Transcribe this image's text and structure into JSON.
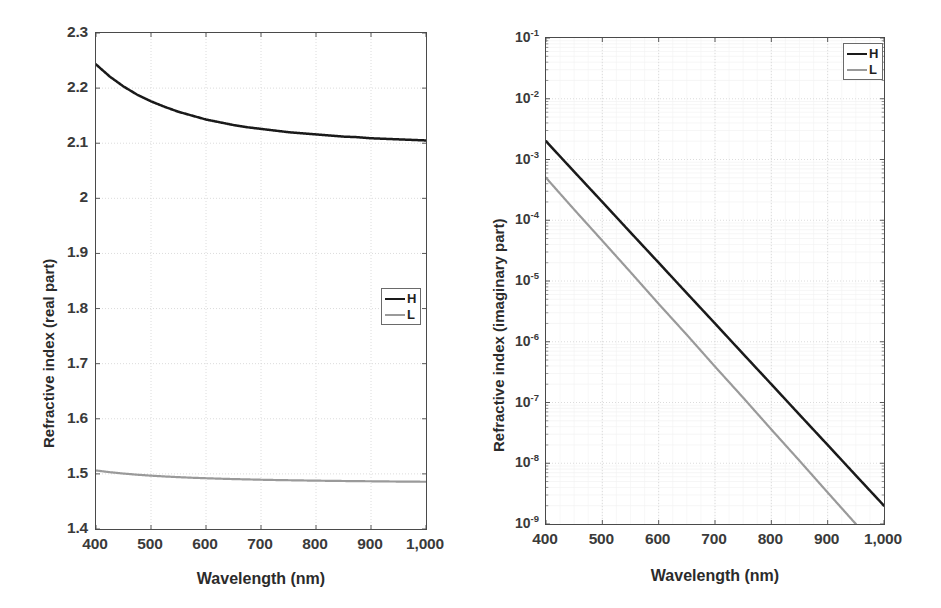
{
  "figure": {
    "panels": [
      {
        "id": "real-part",
        "legend": [
          {
            "key": "H",
            "label": "H",
            "color": "#1a1a1a"
          },
          {
            "key": "L",
            "label": "L",
            "color": "#9a9a9a"
          }
        ]
      },
      {
        "id": "imaginary-part",
        "legend": [
          {
            "key": "H",
            "label": "H",
            "color": "#1a1a1a"
          },
          {
            "key": "L",
            "label": "L",
            "color": "#9a9a9a"
          }
        ]
      }
    ]
  },
  "chart_data": [
    {
      "type": "line",
      "id": "real-part",
      "title": "",
      "xlabel": "Wavelength (nm)",
      "ylabel": "Refractive index (real part)",
      "xlim": [
        400,
        1000
      ],
      "ylim": [
        1.4,
        2.3
      ],
      "yscale": "linear",
      "xscale": "linear",
      "grid": true,
      "xticks": [
        400,
        500,
        600,
        700,
        800,
        900,
        1000
      ],
      "xticklabels": [
        "400",
        "500",
        "600",
        "700",
        "800",
        "900",
        "1,000"
      ],
      "yticks": [
        1.4,
        1.5,
        1.6,
        1.7,
        1.8,
        1.9,
        2.0,
        2.1,
        2.2,
        2.3
      ],
      "yticklabels": [
        "1.4",
        "1.5",
        "1.6",
        "1.7",
        "1.8",
        "1.9",
        "2",
        "2.1",
        "2.2",
        "2.3"
      ],
      "legend_position": "right-middle",
      "x": [
        400,
        425,
        450,
        475,
        500,
        525,
        550,
        575,
        600,
        625,
        650,
        675,
        700,
        725,
        750,
        775,
        800,
        825,
        850,
        875,
        900,
        925,
        950,
        975,
        1000
      ],
      "series": [
        {
          "name": "H",
          "color": "#1a1a1a",
          "values": [
            2.243,
            2.221,
            2.203,
            2.188,
            2.176,
            2.166,
            2.157,
            2.15,
            2.143,
            2.138,
            2.133,
            2.129,
            2.126,
            2.123,
            2.12,
            2.118,
            2.116,
            2.114,
            2.112,
            2.111,
            2.109,
            2.108,
            2.107,
            2.106,
            2.105
          ]
        },
        {
          "name": "L",
          "color": "#9a9a9a",
          "values": [
            1.5062,
            1.5031,
            1.5006,
            1.4985,
            1.4968,
            1.4953,
            1.4941,
            1.493,
            1.4921,
            1.4913,
            1.4906,
            1.49,
            1.4894,
            1.4889,
            1.4885,
            1.4881,
            1.4877,
            1.4874,
            1.4871,
            1.4868,
            1.4866,
            1.4863,
            1.4861,
            1.4859,
            1.4857
          ]
        }
      ]
    },
    {
      "type": "line",
      "id": "imaginary-part",
      "title": "",
      "xlabel": "Wavelength (nm)",
      "ylabel": "Refractive index (imaginary part)",
      "xlim": [
        400,
        1000
      ],
      "ylim": [
        1e-09,
        0.1
      ],
      "yscale": "log",
      "xscale": "linear",
      "grid": true,
      "xticks": [
        400,
        500,
        600,
        700,
        800,
        900,
        1000
      ],
      "xticklabels": [
        "400",
        "500",
        "600",
        "700",
        "800",
        "900",
        "1,000"
      ],
      "yticks": [
        1e-09,
        1e-08,
        1e-07,
        1e-06,
        1e-05,
        0.0001,
        0.001,
        0.01,
        0.1
      ],
      "yticklabels": [
        "10-9",
        "10-8",
        "10-7",
        "10-6",
        "10-5",
        "10-4",
        "10-3",
        "10-2",
        "10-1"
      ],
      "ytickmantissa": "10",
      "ytickexponents": [
        "-9",
        "-8",
        "-7",
        "-6",
        "-5",
        "-4",
        "-3",
        "-2",
        "-1"
      ],
      "legend_position": "top-right",
      "x": [
        400,
        450,
        500,
        550,
        600,
        650,
        700,
        750,
        800,
        850,
        900,
        950,
        1000
      ],
      "series": [
        {
          "name": "H",
          "color": "#1a1a1a",
          "values": [
            0.002,
            0.00063,
            0.0002,
            6.3e-05,
            2e-05,
            6.3e-06,
            2e-06,
            6.3e-07,
            2e-07,
            6.3e-08,
            2e-08,
            6.3e-09,
            2e-09
          ]
        },
        {
          "name": "L",
          "color": "#9a9a9a",
          "values": [
            0.0005,
            0.00015,
            4.6e-05,
            1.4e-05,
            4.2e-06,
            1.3e-06,
            3.9e-07,
            1.2e-07,
            3.6e-08,
            1.1e-08,
            3.3e-09,
            1e-09,
            null
          ]
        }
      ]
    }
  ]
}
